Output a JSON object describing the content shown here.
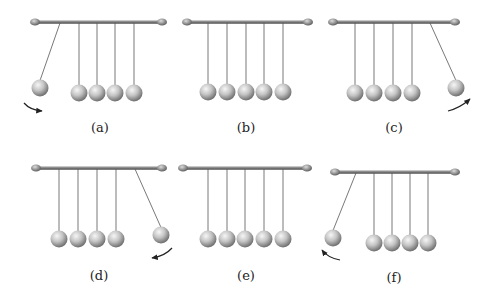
{
  "figure": {
    "colors": {
      "bar": "#6f6f6f",
      "bar_highlight": "#b8b8b8",
      "ball_light": "#f4f4f4",
      "ball_mid": "#bdbdbd",
      "ball_dark": "#6a6a6a",
      "string": "#555555",
      "arrow": "#222222",
      "label": "#222222"
    },
    "panels": [
      {
        "id": "a",
        "label": "(a)",
        "bar": {
          "x1": 35,
          "x2": 162,
          "y": 22
        },
        "anchors": [
          60,
          79,
          97,
          115,
          134
        ],
        "rest_y": 93,
        "balls": [
          {
            "ax": 60,
            "bx": 40,
            "by": 88
          },
          {
            "ax": 79,
            "bx": 79,
            "by": 93
          },
          {
            "ax": 97,
            "bx": 97,
            "by": 93
          },
          {
            "ax": 115,
            "bx": 115,
            "by": 93
          },
          {
            "ax": 134,
            "bx": 134,
            "by": 93
          }
        ],
        "arrow": {
          "d": "M24,103 Q30,110 42,111",
          "head": "end"
        },
        "label_pos": {
          "x": 100,
          "y": 132
        }
      },
      {
        "id": "b",
        "label": "(b)",
        "bar": {
          "x1": 187,
          "x2": 308,
          "y": 22
        },
        "anchors": [
          208,
          227,
          246,
          264,
          283
        ],
        "rest_y": 92,
        "balls": [
          {
            "ax": 208,
            "bx": 208,
            "by": 92
          },
          {
            "ax": 227,
            "bx": 227,
            "by": 92
          },
          {
            "ax": 246,
            "bx": 246,
            "by": 92
          },
          {
            "ax": 264,
            "bx": 264,
            "by": 92
          },
          {
            "ax": 283,
            "bx": 283,
            "by": 92
          }
        ],
        "arrow": null,
        "label_pos": {
          "x": 246,
          "y": 132
        }
      },
      {
        "id": "c",
        "label": "(c)",
        "bar": {
          "x1": 333,
          "x2": 455,
          "y": 22
        },
        "anchors": [
          355,
          374,
          393,
          412,
          430
        ],
        "rest_y": 93,
        "balls": [
          {
            "ax": 355,
            "bx": 355,
            "by": 93
          },
          {
            "ax": 374,
            "bx": 374,
            "by": 93
          },
          {
            "ax": 393,
            "bx": 393,
            "by": 93
          },
          {
            "ax": 412,
            "bx": 412,
            "by": 93
          },
          {
            "ax": 430,
            "bx": 456,
            "by": 88
          }
        ],
        "arrow": {
          "d": "M448,111 Q460,108 470,99",
          "head": "end"
        },
        "label_pos": {
          "x": 394,
          "y": 132
        }
      },
      {
        "id": "d",
        "label": "(d)",
        "bar": {
          "x1": 36,
          "x2": 162,
          "y": 168
        },
        "anchors": [
          59,
          78,
          97,
          116,
          135
        ],
        "rest_y": 239,
        "balls": [
          {
            "ax": 59,
            "bx": 59,
            "by": 239
          },
          {
            "ax": 78,
            "bx": 78,
            "by": 239
          },
          {
            "ax": 97,
            "bx": 97,
            "by": 239
          },
          {
            "ax": 116,
            "bx": 116,
            "by": 239
          },
          {
            "ax": 135,
            "bx": 161,
            "by": 235
          }
        ],
        "arrow": {
          "d": "M172,248 Q165,256 152,258",
          "head": "end"
        },
        "label_pos": {
          "x": 99,
          "y": 280
        }
      },
      {
        "id": "e",
        "label": "(e)",
        "bar": {
          "x1": 183,
          "x2": 307,
          "y": 168
        },
        "anchors": [
          208,
          227,
          245,
          264,
          283
        ],
        "rest_y": 239,
        "balls": [
          {
            "ax": 208,
            "bx": 208,
            "by": 239
          },
          {
            "ax": 227,
            "bx": 227,
            "by": 239
          },
          {
            "ax": 245,
            "bx": 245,
            "by": 239
          },
          {
            "ax": 264,
            "bx": 264,
            "by": 239
          },
          {
            "ax": 283,
            "bx": 283,
            "by": 239
          }
        ],
        "arrow": null,
        "label_pos": {
          "x": 246,
          "y": 280
        }
      },
      {
        "id": "f",
        "label": "(f)",
        "bar": {
          "x1": 335,
          "x2": 455,
          "y": 172
        },
        "anchors": [
          356,
          374,
          392,
          410,
          428
        ],
        "rest_y": 243,
        "balls": [
          {
            "ax": 356,
            "bx": 333,
            "by": 238
          },
          {
            "ax": 374,
            "bx": 374,
            "by": 243
          },
          {
            "ax": 392,
            "bx": 392,
            "by": 243
          },
          {
            "ax": 410,
            "bx": 410,
            "by": 243
          },
          {
            "ax": 428,
            "bx": 428,
            "by": 243
          }
        ],
        "arrow": {
          "d": "M340,260 Q328,258 322,250",
          "head": "end"
        },
        "label_pos": {
          "x": 394,
          "y": 282
        }
      }
    ]
  }
}
